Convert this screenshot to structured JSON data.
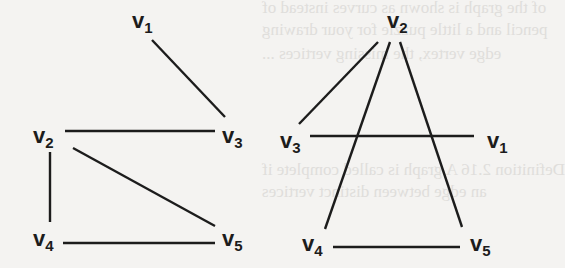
{
  "figure": {
    "graphs": [
      {
        "id": "left",
        "vertices": [
          {
            "id": "v1",
            "name": "v",
            "sub": "1"
          },
          {
            "id": "v2",
            "name": "v",
            "sub": "2"
          },
          {
            "id": "v3",
            "name": "v",
            "sub": "3"
          },
          {
            "id": "v4",
            "name": "v",
            "sub": "4"
          },
          {
            "id": "v5",
            "name": "v",
            "sub": "5"
          }
        ],
        "edges": [
          [
            "v1",
            "v3"
          ],
          [
            "v2",
            "v3"
          ],
          [
            "v2",
            "v4"
          ],
          [
            "v2",
            "v5"
          ],
          [
            "v4",
            "v5"
          ]
        ]
      },
      {
        "id": "right",
        "vertices": [
          {
            "id": "v2",
            "name": "v",
            "sub": "2"
          },
          {
            "id": "v3",
            "name": "v",
            "sub": "3"
          },
          {
            "id": "v1",
            "name": "v",
            "sub": "1"
          },
          {
            "id": "v4",
            "name": "v",
            "sub": "4"
          },
          {
            "id": "v5",
            "name": "v",
            "sub": "5"
          }
        ],
        "edges": [
          [
            "v2",
            "v3"
          ],
          [
            "v2",
            "v4"
          ],
          [
            "v2",
            "v5"
          ],
          [
            "v3",
            "v1"
          ],
          [
            "v4",
            "v5"
          ]
        ]
      }
    ]
  },
  "bleed_through_text": [
    "of the graph is shown as curves instead of",
    "pencil and a little puzzle for your drawing",
    "edge vertex, the missing vertices ...",
    "Definition 2.16 A graph is called complete if",
    "an edge between distinct vertices"
  ]
}
